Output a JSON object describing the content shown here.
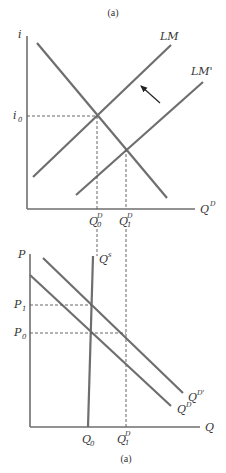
{
  "top_panel": {
    "caption": "(a)",
    "y_axis_label": "i",
    "x_axis_label": "Q",
    "x_axis_label_sup": "D",
    "curves": {
      "lm": "LM",
      "lm_prime": "LM'"
    },
    "y_marks": {
      "i0": "i",
      "i0_sub": "0"
    },
    "x_marks": {
      "q0": "Q",
      "q0_sup": "D",
      "q0_sub": "0",
      "q1": "Q",
      "q1_sup": "D",
      "q1_sub": "1"
    },
    "shift_arrow": "arrow pointing from LM' toward LM (up-left)"
  },
  "bottom_panel": {
    "caption": "(a)",
    "y_axis_label": "P",
    "x_axis_label": "Q",
    "curves": {
      "qs": "Q",
      "qs_sup": "s",
      "qd": "Q",
      "qd_sup": "D",
      "qd_prime": "Q",
      "qd_prime_sup": "D'"
    },
    "y_marks": {
      "p1": "P",
      "p1_sub": "1",
      "p0": "P",
      "p0_sub": "0"
    },
    "x_marks": {
      "q0": "Q",
      "q0_sub": "0",
      "q1": "Q",
      "q1_sup": "D",
      "q1_sub": "1"
    }
  },
  "colors": {
    "line": "#6e6e6e",
    "text": "#333333",
    "background": "#ffffff"
  }
}
